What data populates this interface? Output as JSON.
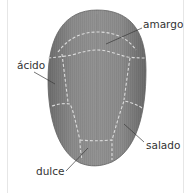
{
  "diagram": {
    "colors": {
      "tongue_fill": "#8a8a8a",
      "tongue_edge": "#6a6a6a",
      "dashes": "#d8d8d8",
      "leader": "#3a3a3a",
      "text": "#333333"
    },
    "labels": {
      "bitter": "amargo",
      "sour": "ácido",
      "salty": "salado",
      "sweet": "dulce"
    }
  }
}
